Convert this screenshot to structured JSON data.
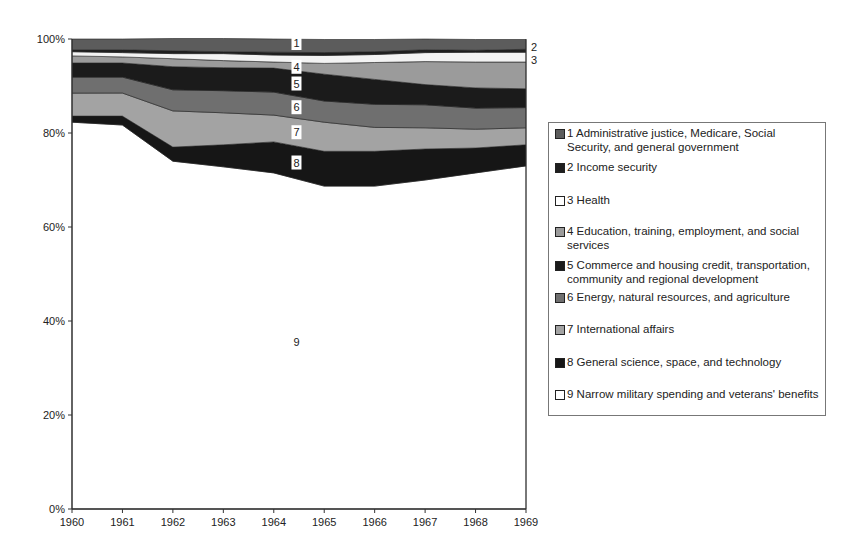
{
  "chart_data": {
    "type": "area",
    "stacked": true,
    "normalized": true,
    "title": "",
    "xlabel": "",
    "ylabel": "",
    "x": [
      1960,
      1961,
      1962,
      1963,
      1964,
      1965,
      1966,
      1967,
      1968,
      1969
    ],
    "ylim": [
      0,
      100
    ],
    "y_ticks": [
      "0%",
      "20%",
      "40%",
      "60%",
      "80%",
      "100%"
    ],
    "grid": false,
    "legend_position": "right",
    "series": [
      {
        "id": "9",
        "name": "9 Narrow military spending and veterans' benefits",
        "color": "#ffffff",
        "values": [
          82.3,
          81.7,
          74.0,
          72.8,
          71.5,
          68.7,
          68.7,
          70.0,
          71.5,
          73.0
        ]
      },
      {
        "id": "8",
        "name": "8 General science, space, and technology",
        "color": "#161616",
        "values": [
          1.3,
          1.9,
          3.0,
          4.7,
          6.6,
          7.4,
          7.4,
          6.6,
          5.3,
          4.5
        ]
      },
      {
        "id": "7",
        "name": "7 International affairs",
        "color": "#a3a3a3",
        "values": [
          4.9,
          4.9,
          7.7,
          6.8,
          5.7,
          6.2,
          5.1,
          4.5,
          4.0,
          3.6
        ]
      },
      {
        "id": "6",
        "name": "6 Energy, natural resources,  and agriculture",
        "color": "#6f6f6f",
        "values": [
          3.4,
          3.4,
          4.5,
          4.7,
          4.9,
          4.5,
          4.9,
          4.9,
          4.5,
          4.3
        ]
      },
      {
        "id": "5",
        "name": "5 Commerce and housing credit, transportation, community and regional development",
        "color": "#1b1b1b",
        "values": [
          3.0,
          3.0,
          4.9,
          4.9,
          5.1,
          5.7,
          5.3,
          4.3,
          4.3,
          4.0
        ]
      },
      {
        "id": "4",
        "name": "4 Education, training, employment, and social services",
        "color": "#9b9b9b",
        "values": [
          1.5,
          1.3,
          1.7,
          1.5,
          1.3,
          2.3,
          3.6,
          4.9,
          5.5,
          5.7
        ]
      },
      {
        "id": "3",
        "name": "3 Health",
        "color": "#f3f3f3",
        "values": [
          0.9,
          0.9,
          1.1,
          1.5,
          1.5,
          1.7,
          1.7,
          1.9,
          2.1,
          2.1
        ]
      },
      {
        "id": "2",
        "name": "2 Income security",
        "color": "#1f1f1f",
        "values": [
          0.4,
          0.6,
          0.6,
          0.4,
          0.6,
          0.6,
          0.6,
          0.6,
          0.4,
          0.6
        ]
      },
      {
        "id": "1",
        "name": "1 Administrative justice, Medicare, Social Security, and general government",
        "color": "#5c5c5c",
        "values": [
          2.3,
          2.3,
          2.6,
          2.8,
          2.8,
          2.8,
          2.6,
          2.3,
          2.3,
          2.1
        ]
      }
    ],
    "annotations": [
      {
        "text": "1",
        "placement": "in-area",
        "x": 1964.45
      },
      {
        "text": "4",
        "placement": "in-area",
        "x": 1964.45
      },
      {
        "text": "5",
        "placement": "in-area",
        "x": 1964.45
      },
      {
        "text": "6",
        "placement": "in-area",
        "x": 1964.45
      },
      {
        "text": "7",
        "placement": "in-area",
        "x": 1964.45
      },
      {
        "text": "8",
        "placement": "in-area",
        "x": 1964.45
      },
      {
        "text": "9",
        "placement": "in-area",
        "x": 1964.45
      },
      {
        "text": "2",
        "placement": "right-edge"
      },
      {
        "text": "3",
        "placement": "right-edge"
      }
    ]
  },
  "legend": {
    "items": [
      {
        "label": "1 Administrative justice, Medicare, Social Security, and general government",
        "swatch": "#5c5c5c"
      },
      {
        "label": "2 Income security",
        "swatch": "#1f1f1f"
      },
      {
        "label": "3 Health",
        "swatch": "#ffffff"
      },
      {
        "label": "4 Education, training, employment, and social services",
        "swatch": "#9b9b9b"
      },
      {
        "label": "5 Commerce and housing credit, transportation, community and regional development",
        "swatch": "#1b1b1b"
      },
      {
        "label": "6 Energy, natural resources,  and agriculture",
        "swatch": "#6f6f6f"
      },
      {
        "label": "7 International affairs",
        "swatch": "#a3a3a3"
      },
      {
        "label": "8 General science, space, and technology",
        "swatch": "#161616"
      },
      {
        "label": "9 Narrow military spending and veterans' benefits",
        "swatch": "#ffffff"
      }
    ]
  }
}
